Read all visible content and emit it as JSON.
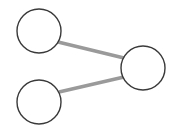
{
  "canvas": {
    "width": 173,
    "height": 137,
    "background_color": "#ffffff"
  },
  "diagram": {
    "type": "node-link-diagram",
    "node_count": 3,
    "edge_count": 2,
    "node_style": {
      "fill_color": "#ffffff",
      "stroke_color": "#3a3a3a",
      "stroke_width": 1.4,
      "radius": 22
    },
    "edge_style": {
      "stroke_color": "#9a9a9a",
      "stroke_width": 3.6
    },
    "nodes": [
      {
        "id": "n1",
        "name": "top-left-node",
        "cx": 39,
        "cy": 31,
        "r": 22,
        "label": ""
      },
      {
        "id": "n2",
        "name": "bottom-left-node",
        "cx": 39,
        "cy": 102,
        "r": 22,
        "label": ""
      },
      {
        "id": "n3",
        "name": "right-node",
        "cx": 143,
        "cy": 68,
        "r": 22,
        "label": ""
      }
    ],
    "edges": [
      {
        "id": "e1",
        "name": "edge-top-left-to-right",
        "source": "n1",
        "target": "n3",
        "x1": 58,
        "y1": 42,
        "x2": 124,
        "y2": 58
      },
      {
        "id": "e2",
        "name": "edge-bottom-left-to-right",
        "source": "n2",
        "target": "n3",
        "x1": 59,
        "y1": 92,
        "x2": 124,
        "y2": 77
      }
    ]
  }
}
